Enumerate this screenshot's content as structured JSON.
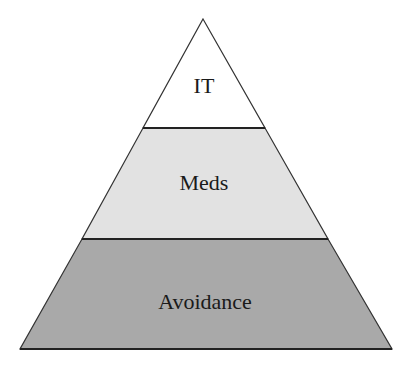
{
  "diagram": {
    "type": "pyramid",
    "levels": [
      {
        "label": "IT",
        "position": "top",
        "fill": "#ffffff"
      },
      {
        "label": "Meds",
        "position": "middle",
        "fill": "#e2e2e2"
      },
      {
        "label": "Avoidance",
        "position": "bottom",
        "fill": "#a9a9a9"
      }
    ],
    "stroke": "#333333"
  }
}
